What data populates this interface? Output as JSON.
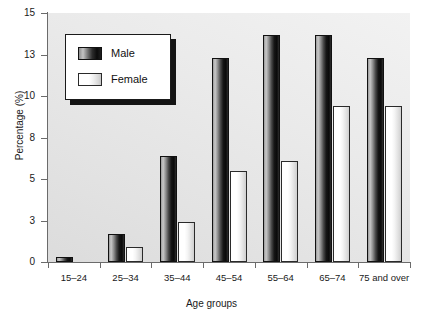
{
  "chart_data": {
    "type": "bar",
    "title": "",
    "xlabel": "Age groups",
    "ylabel": "Percentage (%)",
    "categories": [
      "15–24",
      "25–34",
      "35–44",
      "45–54",
      "55–64",
      "65–74",
      "75 and over"
    ],
    "series": [
      {
        "name": "Male",
        "values": [
          0.3,
          1.7,
          6.4,
          12.3,
          13.7,
          13.7,
          12.3
        ],
        "color": "#101010"
      },
      {
        "name": "Female",
        "values": [
          0.0,
          0.9,
          2.4,
          5.5,
          6.1,
          9.4,
          9.4
        ],
        "color": "#ffffff"
      }
    ],
    "ylim": [
      0,
      15
    ],
    "ytick_values": [
      0,
      2.5,
      5,
      7.5,
      10,
      12.5,
      15
    ],
    "ytick_labels": [
      "0",
      "3",
      "5",
      "8",
      "10",
      "13",
      "15"
    ],
    "grid": false,
    "legend_position": "upper-left"
  },
  "legend": {
    "entries": [
      {
        "label": "Male"
      },
      {
        "label": "Female"
      }
    ]
  },
  "axes": {
    "y_title": "Percentage (%)",
    "x_title": "Age groups"
  }
}
